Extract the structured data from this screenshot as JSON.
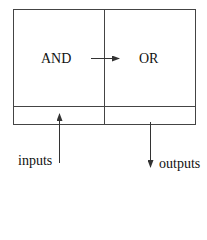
{
  "diagram": {
    "blocks": [
      {
        "id": "and",
        "label": "AND"
      },
      {
        "id": "or",
        "label": "OR"
      }
    ],
    "edges": [
      {
        "from": "and",
        "to": "or"
      }
    ],
    "io": {
      "inputs_label": "inputs",
      "outputs_label": "outputs"
    },
    "colors": {
      "stroke": "#333333",
      "text": "#111111",
      "background": "#ffffff"
    }
  }
}
